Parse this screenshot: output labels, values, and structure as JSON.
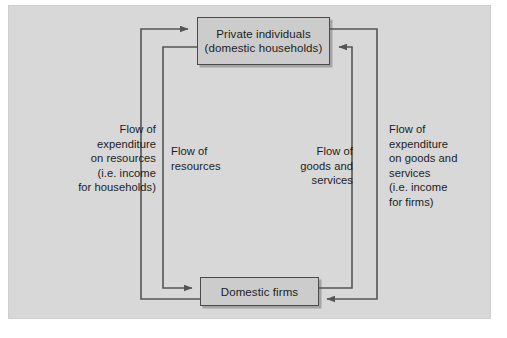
{
  "figure": {
    "panel_color": "#d8d8d8",
    "box_fill_color": "#cccccc",
    "line_color": "#555555"
  },
  "nodes": {
    "households": {
      "line1": "Private individuals",
      "line2": "(domestic households)"
    },
    "firms": {
      "line1": "Domestic firms"
    }
  },
  "labels": {
    "expenditure_on_resources": "Flow of\nexpenditure\non resources\n(i.e. income\nfor households)",
    "flow_of_resources": "Flow of\nresources",
    "flow_of_goods_and_services": "Flow of\ngoods and\nservices",
    "expenditure_on_goods": "Flow of\nexpenditure\non goods and\nservices\n(i.e. income\nfor firms)"
  },
  "flows": [
    {
      "name": "expenditure-on-resources",
      "from": "Domestic firms",
      "to": "Private individuals (domestic households)",
      "side": "left",
      "loop": "outer",
      "direction": "upward"
    },
    {
      "name": "flow-of-resources",
      "from": "Private individuals (domestic households)",
      "to": "Domestic firms",
      "side": "left",
      "loop": "inner",
      "direction": "downward"
    },
    {
      "name": "flow-of-goods-and-services",
      "from": "Domestic firms",
      "to": "Private individuals (domestic households)",
      "side": "right",
      "loop": "inner",
      "direction": "upward"
    },
    {
      "name": "expenditure-on-goods-and-services",
      "from": "Private individuals (domestic households)",
      "to": "Domestic firms",
      "side": "right",
      "loop": "outer",
      "direction": "downward"
    }
  ]
}
